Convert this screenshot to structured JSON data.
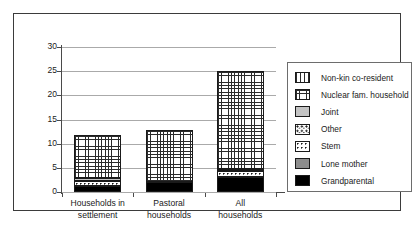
{
  "chart_data": {
    "type": "bar",
    "subtype": "stacked",
    "title": "",
    "xlabel": "",
    "ylabel": "",
    "ylim": [
      0,
      30
    ],
    "yticks": [
      0,
      5,
      10,
      15,
      20,
      25,
      30
    ],
    "ytick_labels": [
      "0",
      "5",
      "10",
      "15",
      "20",
      "25",
      "30"
    ],
    "grid": true,
    "grid_axis": "y",
    "legend_position": "right",
    "categories": [
      "Households in settlement",
      "Pastoral households",
      "All households"
    ],
    "category_lines": [
      [
        "Households in",
        "settlement"
      ],
      [
        "Pastoral",
        "households"
      ],
      [
        "All",
        "households"
      ]
    ],
    "series": [
      {
        "name": "Grandparental",
        "key": "grandparental",
        "values": [
          1.3,
          2.0,
          3.2
        ]
      },
      {
        "name": "Lone mother",
        "key": "lone-mother",
        "values": [
          0.0,
          0.0,
          0.0
        ]
      },
      {
        "name": "Stem",
        "key": "stem",
        "values": [
          1.0,
          0.0,
          1.1
        ]
      },
      {
        "name": "Other",
        "key": "other",
        "values": [
          0.0,
          0.0,
          0.0
        ]
      },
      {
        "name": "Joint",
        "key": "joint",
        "values": [
          0.7,
          0.0,
          0.5
        ]
      },
      {
        "name": "Nuclear fam. household",
        "key": "nuclear",
        "values": [
          8.8,
          10.9,
          20.2
        ]
      },
      {
        "name": "Non-kin co-resident",
        "key": "nonkin",
        "values": [
          0.0,
          0.0,
          0.0
        ]
      }
    ],
    "totals": [
      11.8,
      12.9,
      25.0
    ]
  },
  "legend": {
    "items": [
      {
        "label": "Non-kin co-resident",
        "pattern": "vertical-lines",
        "key": "nonkin"
      },
      {
        "label": "Nuclear fam. household",
        "pattern": "crosshatch-grid",
        "key": "nuclear"
      },
      {
        "label": "Joint",
        "pattern": "light-gray-fill",
        "key": "joint"
      },
      {
        "label": "Other",
        "pattern": "speckled-dots",
        "key": "other"
      },
      {
        "label": "Stem",
        "pattern": "circles-dots",
        "key": "stem"
      },
      {
        "label": "Lone mother",
        "pattern": "gray-fill",
        "key": "lone-mother"
      },
      {
        "label": "Grandparental",
        "pattern": "solid-black",
        "key": "grandparental"
      }
    ]
  },
  "colors": {
    "frame": "#3b3b3b",
    "axis": "#4a4a4a",
    "gridline": "#aaaaaa",
    "text": "#1a1a1a",
    "grandparental": "#000000",
    "lone_mother": "#8d8d8d",
    "joint": "#c4c4c4",
    "background": "#ffffff"
  }
}
